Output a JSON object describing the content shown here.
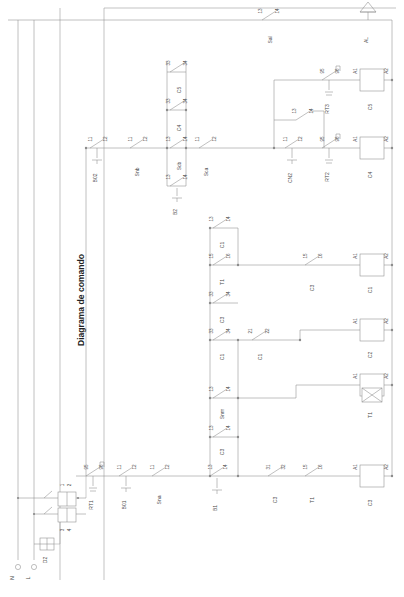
{
  "diagram": {
    "title": "Diagrama de comando",
    "supply": {
      "neutral_label": "N",
      "phase_label": "L",
      "fuse_label": "D2",
      "disconnect_terminals": [
        "1",
        "2",
        "3",
        "4"
      ]
    },
    "alarm": {
      "device": "AL",
      "icon": "horn-icon",
      "contact": {
        "device": "Sal",
        "left": "13",
        "right": "14"
      }
    },
    "coils": [
      {
        "name": "C5",
        "a1": "A1",
        "a2": "A2"
      },
      {
        "name": "C4",
        "a1": "A1",
        "a2": "A2"
      },
      {
        "name": "C1",
        "a1": "A1",
        "a2": "A2"
      },
      {
        "name": "C2",
        "a1": "A1",
        "a2": "A2"
      },
      {
        "name": "T1",
        "a1": "A1",
        "a2": "A2",
        "icon": "timer-icon"
      },
      {
        "name": "C3",
        "a1": "A1",
        "a2": "A2"
      }
    ],
    "contacts": [
      {
        "device": "B02",
        "left": "11",
        "right": "12",
        "type": "nc-button"
      },
      {
        "device": "Snb",
        "left": "11",
        "right": "12",
        "type": "nc"
      },
      {
        "device": "Scb",
        "left": "13",
        "right": "14",
        "type": "no"
      },
      {
        "device": "B2",
        "left": "13",
        "right": "14",
        "type": "no-button"
      },
      {
        "device": "Sca",
        "left": "11",
        "right": "12",
        "type": "nc"
      },
      {
        "device": "C4",
        "left": "33",
        "right": "34",
        "type": "no"
      },
      {
        "device": "C5",
        "left": "33",
        "right": "34",
        "type": "no"
      },
      {
        "device": "CN2",
        "left": "11",
        "right": "12",
        "type": "nc-button"
      },
      {
        "device": "RT2",
        "left": "95",
        "right": "96",
        "type": "thermal"
      },
      {
        "device": "RT3",
        "left": "95",
        "right": "96",
        "type": "thermal"
      },
      {
        "device": "C1",
        "left": "13",
        "right": "14",
        "type": "no"
      },
      {
        "device": "T1",
        "left": "15",
        "right": "16",
        "type": "no"
      },
      {
        "device": "C3",
        "left": "33",
        "right": "34",
        "type": "no"
      },
      {
        "device": "C1",
        "left": "33",
        "right": "34",
        "type": "no"
      },
      {
        "device": "C1",
        "left": "21",
        "right": "22",
        "type": "nc"
      },
      {
        "device": "Snm",
        "left": "13",
        "right": "14",
        "type": "no"
      },
      {
        "device": "C3",
        "left": "15",
        "right": "16",
        "type": "no"
      },
      {
        "device": "RT1",
        "left": "95",
        "right": "96",
        "type": "thermal"
      },
      {
        "device": "B01",
        "left": "11",
        "right": "12",
        "type": "nc-button"
      },
      {
        "device": "Sna",
        "left": "11",
        "right": "12",
        "type": "nc"
      },
      {
        "device": "B1",
        "left": "13",
        "right": "14",
        "type": "no-button"
      },
      {
        "device": "C3",
        "left": "31",
        "right": "32",
        "type": "nc"
      },
      {
        "device": "T1",
        "left": "15",
        "right": "16",
        "type": "no"
      },
      {
        "device": "C3",
        "left": "13",
        "right": "14",
        "type": "no"
      }
    ]
  }
}
